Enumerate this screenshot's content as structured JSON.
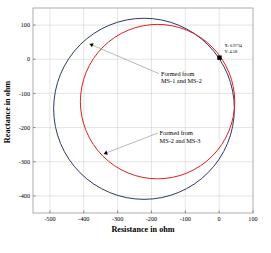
{
  "chart_data": {
    "type": "line",
    "title": "",
    "xlabel": "Resistance in ohm",
    "ylabel": "Reactance in ohm",
    "xlim": [
      -550,
      100
    ],
    "ylim": [
      -450,
      150
    ],
    "xticks": [
      -500,
      -400,
      -300,
      -200,
      -100,
      0,
      100
    ],
    "xticklabels": [
      "-500",
      "-400",
      "-300",
      "-200",
      "-100",
      "0",
      "100"
    ],
    "yticks": [
      100,
      0,
      -100,
      -200,
      -300,
      -400
    ],
    "yticklabels": [
      "100",
      "0",
      "-100",
      "-200",
      "-300",
      "-400"
    ],
    "grid": true,
    "legend_position": "none",
    "series": [
      {
        "name": "Formed from MS-1 and MS-2",
        "color": "#2b3a67",
        "shape": "circle",
        "center_x": -222,
        "center_y": -145,
        "radius_x": 267,
        "radius_y": 265,
        "x_min": -489,
        "x_max": 45,
        "y_min": -410,
        "y_max": 120
      },
      {
        "name": "Formed from MS-2 and MS-3",
        "color": "#e02020",
        "shape": "circle",
        "center_x": -182,
        "center_y": -124,
        "radius_x": 228,
        "radius_y": 226,
        "x_min": -410,
        "x_max": 46,
        "y_min": -350,
        "y_max": 102
      }
    ],
    "annotations": [
      {
        "name": "annotation-ms1-ms2",
        "line1": "Formed from",
        "line2": "MS-1 and MS-2",
        "text_x": -172,
        "text_y": -48,
        "point_x": -383,
        "point_y": 45
      },
      {
        "name": "annotation-ms2-ms3",
        "line1": "Formed from",
        "line2": "MS-2 and MS-3",
        "text_x": -176,
        "text_y": -222,
        "point_x": -341,
        "point_y": -277
      }
    ],
    "datatip": {
      "x_label": "X: 0.9734",
      "y_label": "Y: 4.58",
      "x_value": 0.9734,
      "y_value": 4.58,
      "marker": "square",
      "marker_color": "#000000"
    }
  }
}
